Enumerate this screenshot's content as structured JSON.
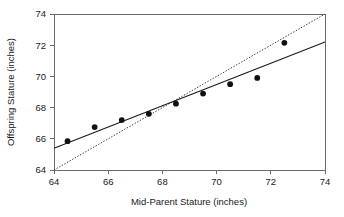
{
  "chart_data": {
    "type": "scatter",
    "title": "",
    "xlabel": "Mid-Parent Stature (inches)",
    "ylabel": "Offspring Stature (inches)",
    "xlim": [
      64,
      74
    ],
    "ylim": [
      64,
      74
    ],
    "xticks": [
      64,
      66,
      68,
      70,
      72,
      74
    ],
    "yticks": [
      64,
      66,
      68,
      70,
      72,
      74
    ],
    "xtick_labels": [
      "64",
      "66",
      "68",
      "70",
      "72",
      "74"
    ],
    "ytick_labels": [
      "64",
      "66",
      "68",
      "70",
      "72",
      "74"
    ],
    "grid": false,
    "legend": "none",
    "points": [
      {
        "x": 64.5,
        "y": 65.85
      },
      {
        "x": 65.5,
        "y": 66.75
      },
      {
        "x": 66.5,
        "y": 67.2
      },
      {
        "x": 67.5,
        "y": 67.6
      },
      {
        "x": 68.5,
        "y": 68.25
      },
      {
        "x": 69.5,
        "y": 68.9
      },
      {
        "x": 70.5,
        "y": 69.5
      },
      {
        "x": 71.5,
        "y": 69.9
      },
      {
        "x": 72.5,
        "y": 72.15
      }
    ],
    "series": [
      {
        "name": "regression-line",
        "style": "solid",
        "x": [
          64,
          74
        ],
        "values": [
          65.4,
          72.2
        ]
      },
      {
        "name": "identity-line",
        "style": "dotted",
        "x": [
          64,
          74
        ],
        "values": [
          64,
          74
        ]
      }
    ],
    "marker_color": "#111111",
    "regression_line_color": "#1a1a1a",
    "identity_line_color": "#3a3a3a",
    "axis_color": "#6b6b6b",
    "background_color": "#ffffff"
  }
}
